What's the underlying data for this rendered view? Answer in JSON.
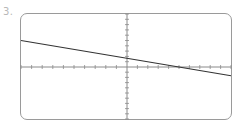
{
  "problem": {
    "number_label": "3."
  },
  "colors": {
    "frame": "#9a9a9a",
    "axis": "#8a8a8a",
    "line": "#333333",
    "label": "#b8b8b8"
  },
  "chart_data": {
    "type": "line",
    "title": "",
    "xlabel": "",
    "ylabel": "",
    "xlim": [
      -10,
      10
    ],
    "ylim": [
      -10,
      10
    ],
    "x_tick_step": 1,
    "y_tick_step": 1,
    "grid": false,
    "tick_labels": false,
    "series": [
      {
        "name": "line",
        "equation": "y = -x/3 + 5/3",
        "x": [
          -10,
          10
        ],
        "y": [
          5,
          -1.667
        ]
      }
    ],
    "annotations": []
  }
}
